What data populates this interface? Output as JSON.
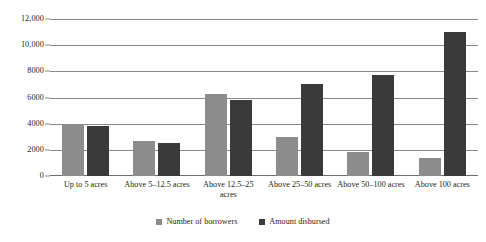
{
  "chart_data": {
    "type": "bar",
    "title": "",
    "subtitle": "",
    "xlabel": "",
    "ylabel": "",
    "ylim": [
      0,
      12000
    ],
    "grid": true,
    "legend_position": "bottom",
    "y_ticks": [
      "0",
      "2000",
      "4000",
      "6000",
      "8000",
      "10,000",
      "12,000"
    ],
    "y_tick_values": [
      0,
      2000,
      4000,
      6000,
      8000,
      10000,
      12000
    ],
    "categories": [
      "Up to 5 acres",
      "Above 5–12.5 acres",
      "Above 12.5–25 acres",
      "Above 25–50 acres",
      "Above 50–100 acres",
      "Above 100 acres"
    ],
    "series": [
      {
        "name": "Number of borrowers",
        "color": "#8c8c8c",
        "values": [
          4000,
          2700,
          6250,
          2950,
          1800,
          1400
        ]
      },
      {
        "name": "Amount disbursed",
        "color": "#3a3a3a",
        "values": [
          3800,
          2500,
          5800,
          7050,
          7700,
          11000
        ]
      }
    ]
  },
  "legend": {
    "items": [
      {
        "label": "Number of borrowers"
      },
      {
        "label": "Amount disbursed"
      }
    ]
  },
  "colors": {
    "series_0": "#8c8c8c",
    "series_1": "#3a3a3a",
    "gridline": "#8a8a8a",
    "text": "#231f20",
    "background": "#ffffff"
  }
}
